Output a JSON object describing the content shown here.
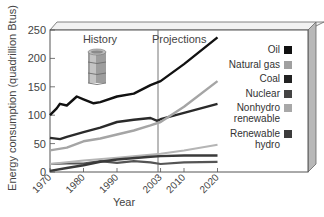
{
  "chart_data": {
    "type": "line",
    "title": "",
    "xlabel": "Year",
    "ylabel": "Energy consumption (quadrillion Btus)",
    "xlim": [
      1970,
      2020
    ],
    "ylim": [
      0,
      250
    ],
    "x_ticks": [
      "1970",
      "1980",
      "1990",
      "2003",
      "2010",
      "2020"
    ],
    "y_ticks": [
      "0",
      "50",
      "100",
      "150",
      "200",
      "250"
    ],
    "annotations": [
      "History",
      "Projections"
    ],
    "divider_year": 2003,
    "grid": false,
    "legend_position": "right",
    "series": [
      {
        "name": "Oil",
        "color": "#111111",
        "width": 2.4,
        "x": [
          1970,
          1972,
          1973,
          1975,
          1978,
          1980,
          1983,
          1985,
          1990,
          1995,
          2000,
          2003,
          2010,
          2020
        ],
        "values": [
          100,
          112,
          120,
          117,
          133,
          128,
          121,
          123,
          133,
          138,
          153,
          160,
          190,
          237
        ]
      },
      {
        "name": "Natural gas",
        "color": "#a5a5a5",
        "width": 2.4,
        "x": [
          1970,
          1975,
          1980,
          1985,
          1990,
          1995,
          2000,
          2003,
          2010,
          2020
        ],
        "values": [
          38,
          43,
          54,
          59,
          66,
          73,
          82,
          88,
          115,
          160
        ]
      },
      {
        "name": "Coal",
        "color": "#2a2a2a",
        "width": 2.4,
        "x": [
          1970,
          1973,
          1975,
          1980,
          1985,
          1990,
          1995,
          2000,
          2002,
          2003,
          2010,
          2020
        ],
        "values": [
          60,
          58,
          62,
          70,
          78,
          88,
          92,
          95,
          90,
          93,
          104,
          120
        ]
      },
      {
        "name": "Nuclear",
        "color": "#3a3a3a",
        "width": 2.4,
        "x": [
          1970,
          1975,
          1980,
          1985,
          1990,
          2000,
          2003,
          2010,
          2020
        ],
        "values": [
          2,
          7,
          12,
          18,
          22,
          27,
          28,
          29,
          29
        ]
      },
      {
        "name": "Nonhydro renewable",
        "color": "#b5b5b5",
        "width": 2.0,
        "x": [
          1970,
          1980,
          1990,
          2003,
          2010,
          2020
        ],
        "values": [
          14,
          20,
          25,
          32,
          38,
          48
        ]
      },
      {
        "name": "Renewable hydro",
        "color": "#555555",
        "width": 2.2,
        "x": [
          1970,
          1975,
          1980,
          1985,
          1990,
          1995,
          2000,
          2003,
          2010,
          2020
        ],
        "values": [
          14,
          15,
          15,
          19,
          16,
          19,
          17,
          14,
          17,
          18
        ]
      }
    ]
  },
  "legend": [
    {
      "label": "Oil",
      "color": "#111111"
    },
    {
      "label": "Natural gas",
      "color": "#a0a0a0"
    },
    {
      "label": "Coal",
      "color": "#222222"
    },
    {
      "label": "Nuclear",
      "color": "#444444"
    },
    {
      "label": "Nonhydro\nrenewable",
      "color": "#a8a8a8"
    },
    {
      "label": "Renewable\nhydro",
      "color": "#3c3c3c"
    }
  ],
  "icons": {
    "barrel": "oil-barrel-icon"
  }
}
